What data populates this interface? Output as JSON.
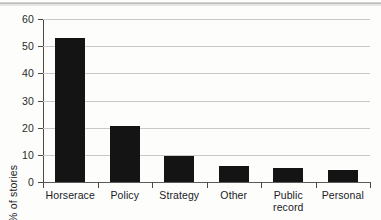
{
  "chart_data": {
    "type": "bar",
    "title": "",
    "xlabel": "",
    "ylabel": "% of stories",
    "categories": [
      "Horserace",
      "Policy",
      "Strategy",
      "Other",
      "Public record",
      "Personal"
    ],
    "values": [
      53,
      20.5,
      9.5,
      6,
      5,
      4.5
    ],
    "ylim": [
      0,
      60
    ],
    "ytick_labels": [
      "0",
      "10",
      "20",
      "30",
      "40",
      "50",
      "60"
    ],
    "ytick_values": [
      0,
      10,
      20,
      30,
      40,
      50,
      60
    ],
    "grid": "horizontal",
    "legend": "none",
    "bar_color": "#141414",
    "gridline_color": "#c9c9c7",
    "axis_color": "#4a4a48",
    "background_color": "#fdfdfc"
  }
}
